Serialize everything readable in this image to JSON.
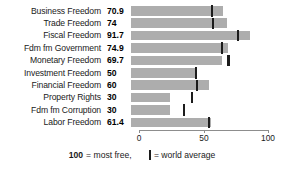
{
  "chart_data": {
    "type": "bar",
    "orientation": "horizontal",
    "title": "",
    "subtitle": "",
    "xlabel": "",
    "ylabel": "",
    "xlim": [
      0,
      100
    ],
    "xticks": [
      0,
      50,
      100
    ],
    "xtick_labels": [
      "0",
      "50",
      "100"
    ],
    "grid": false,
    "legend_position": "bottom-center",
    "bar_color": "#adadad",
    "marker_color": "#1c1c1c",
    "categories": [
      "Business Freedom",
      "Trade Freedom",
      "Fiscal Freedom",
      "Fdm fm Government",
      "Monetary Freedom",
      "Investment Freedom",
      "Financial Freedom",
      "Property Rights",
      "Fdm fm Corruption",
      "Labor Freedom"
    ],
    "values": [
      70.9,
      74,
      91.7,
      74.9,
      69.7,
      50,
      60,
      30,
      30,
      61.4
    ],
    "value_labels": [
      "70.9",
      "74",
      "91.7",
      "74.9",
      "69.7",
      "50",
      "60",
      "30",
      "30",
      "61.4"
    ],
    "series": [
      {
        "name": "Score",
        "values": [
          70.9,
          74,
          91.7,
          74.9,
          69.7,
          50,
          60,
          30,
          30,
          61.4
        ]
      },
      {
        "name": "world average",
        "marker": "vertical-tick",
        "values": [
          62,
          63,
          82,
          70,
          75,
          50,
          51,
          47,
          41,
          60
        ]
      }
    ],
    "rows": [
      {
        "label": "Business Freedom",
        "value_label": "70.9",
        "value": 70.9,
        "world_average": 62
      },
      {
        "label": "Trade Freedom",
        "value_label": "74",
        "value": 74,
        "world_average": 63
      },
      {
        "label": "Fiscal Freedom",
        "value_label": "91.7",
        "value": 91.7,
        "world_average": 82
      },
      {
        "label": "Fdm fm Government",
        "value_label": "74.9",
        "value": 74.9,
        "world_average": 70
      },
      {
        "label": "Monetary Freedom",
        "value_label": "69.7",
        "value": 69.7,
        "world_average": 75
      },
      {
        "label": "Investment Freedom",
        "value_label": "50",
        "value": 50,
        "world_average": 50
      },
      {
        "label": "Financial Freedom",
        "value_label": "60",
        "value": 60,
        "world_average": 51
      },
      {
        "label": "Property Rights",
        "value_label": "30",
        "value": 30,
        "world_average": 47
      },
      {
        "label": "Fdm fm Corruption",
        "value_label": "30",
        "value": 30,
        "world_average": 41
      },
      {
        "label": "Labor Freedom",
        "value_label": "61.4",
        "value": 61.4,
        "world_average": 60
      }
    ],
    "annotations": [
      "100 = most free,",
      "= world average"
    ]
  },
  "legend": {
    "most_free_number": "100",
    "most_free_text": "= most free,",
    "world_average_text": "= world average"
  },
  "axis": {
    "tick_0": "0",
    "tick_50": "50",
    "tick_100": "100"
  }
}
